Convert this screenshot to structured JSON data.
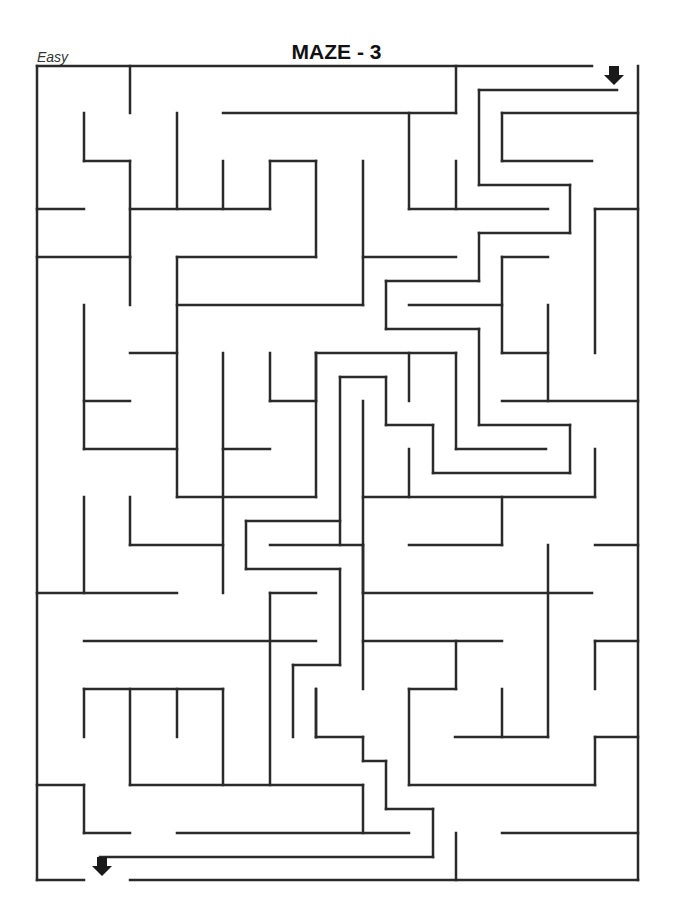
{
  "header": {
    "difficulty": "Easy",
    "title": "MAZE - 3"
  },
  "maze": {
    "wall_color": "#2a2a2a",
    "entrance": {
      "x": 614,
      "y": 76,
      "direction": "down"
    },
    "exit": {
      "x": 102,
      "y": 866,
      "direction": "down"
    },
    "walls": [
      [
        37,
        66,
        592,
        66
      ],
      [
        638,
        66,
        638,
        880
      ],
      [
        37,
        66,
        37,
        880
      ],
      [
        37,
        880,
        84,
        880
      ],
      [
        130,
        880,
        638,
        880
      ],
      [
        130,
        66,
        130,
        113
      ],
      [
        223,
        113,
        456,
        113
      ],
      [
        456,
        66,
        456,
        113
      ],
      [
        84,
        113,
        84,
        161
      ],
      [
        84,
        161,
        130,
        161
      ],
      [
        130,
        161,
        130,
        257
      ],
      [
        37,
        209,
        84,
        209
      ],
      [
        177,
        113,
        177,
        209
      ],
      [
        223,
        161,
        223,
        209
      ],
      [
        130,
        209,
        270,
        209
      ],
      [
        270,
        161,
        270,
        209
      ],
      [
        270,
        161,
        316,
        161
      ],
      [
        316,
        161,
        316,
        257
      ],
      [
        177,
        257,
        316,
        257
      ],
      [
        177,
        257,
        177,
        497
      ],
      [
        37,
        257,
        130,
        257
      ],
      [
        130,
        257,
        130,
        305
      ],
      [
        177,
        305,
        363,
        305
      ],
      [
        409,
        113,
        409,
        209
      ],
      [
        363,
        161,
        363,
        305
      ],
      [
        456,
        161,
        456,
        209
      ],
      [
        409,
        209,
        548,
        209
      ],
      [
        479,
        90,
        479,
        185
      ],
      [
        479,
        90,
        617,
        90
      ],
      [
        502,
        113,
        638,
        113
      ],
      [
        502,
        113,
        502,
        161
      ],
      [
        502,
        161,
        592,
        161
      ],
      [
        479,
        185,
        570,
        185
      ],
      [
        570,
        185,
        570,
        233
      ],
      [
        479,
        233,
        570,
        233
      ],
      [
        479,
        233,
        479,
        281
      ],
      [
        363,
        257,
        456,
        257
      ],
      [
        386,
        281,
        479,
        281
      ],
      [
        386,
        281,
        386,
        329
      ],
      [
        409,
        305,
        502,
        305
      ],
      [
        386,
        329,
        479,
        329
      ],
      [
        479,
        329,
        479,
        425
      ],
      [
        479,
        425,
        570,
        425
      ],
      [
        570,
        425,
        570,
        473
      ],
      [
        433,
        473,
        570,
        473
      ],
      [
        433,
        425,
        433,
        473
      ],
      [
        386,
        425,
        433,
        425
      ],
      [
        386,
        377,
        386,
        425
      ],
      [
        340,
        377,
        386,
        377
      ],
      [
        340,
        377,
        340,
        545
      ],
      [
        363,
        401,
        363,
        593
      ],
      [
        316,
        353,
        456,
        353
      ],
      [
        316,
        353,
        316,
        401
      ],
      [
        409,
        353,
        409,
        401
      ],
      [
        456,
        353,
        456,
        449
      ],
      [
        456,
        449,
        546,
        449
      ],
      [
        502,
        257,
        502,
        353
      ],
      [
        502,
        257,
        548,
        257
      ],
      [
        502,
        353,
        548,
        353
      ],
      [
        548,
        305,
        548,
        401
      ],
      [
        502,
        401,
        638,
        401
      ],
      [
        595,
        209,
        595,
        353
      ],
      [
        595,
        209,
        638,
        209
      ],
      [
        595,
        449,
        595,
        497
      ],
      [
        363,
        497,
        595,
        497
      ],
      [
        502,
        497,
        502,
        545
      ],
      [
        409,
        449,
        409,
        497
      ],
      [
        84,
        305,
        84,
        449
      ],
      [
        130,
        353,
        177,
        353
      ],
      [
        84,
        401,
        130,
        401
      ],
      [
        84,
        449,
        177,
        449
      ],
      [
        223,
        353,
        223,
        593
      ],
      [
        223,
        449,
        270,
        449
      ],
      [
        270,
        353,
        270,
        401
      ],
      [
        270,
        401,
        316,
        401
      ],
      [
        316,
        353,
        316,
        497
      ],
      [
        177,
        497,
        316,
        497
      ],
      [
        84,
        497,
        84,
        593
      ],
      [
        130,
        497,
        130,
        545
      ],
      [
        130,
        545,
        223,
        545
      ],
      [
        37,
        593,
        177,
        593
      ],
      [
        246,
        521,
        340,
        521
      ],
      [
        246,
        521,
        246,
        569
      ],
      [
        246,
        569,
        340,
        569
      ],
      [
        340,
        569,
        340,
        665
      ],
      [
        270,
        545,
        363,
        545
      ],
      [
        270,
        593,
        316,
        593
      ],
      [
        270,
        593,
        270,
        785
      ],
      [
        84,
        641,
        316,
        641
      ],
      [
        293,
        665,
        340,
        665
      ],
      [
        293,
        665,
        293,
        737
      ],
      [
        316,
        689,
        316,
        737
      ],
      [
        84,
        689,
        223,
        689
      ],
      [
        84,
        689,
        84,
        737
      ],
      [
        130,
        689,
        130,
        785
      ],
      [
        177,
        689,
        177,
        737
      ],
      [
        363,
        545,
        363,
        689
      ],
      [
        409,
        545,
        502,
        545
      ],
      [
        363,
        593,
        592,
        593
      ],
      [
        548,
        545,
        548,
        737
      ],
      [
        595,
        545,
        638,
        545
      ],
      [
        363,
        641,
        502,
        641
      ],
      [
        456,
        641,
        456,
        689
      ],
      [
        409,
        689,
        456,
        689
      ],
      [
        409,
        689,
        409,
        785
      ],
      [
        595,
        641,
        595,
        689
      ],
      [
        595,
        641,
        638,
        641
      ],
      [
        502,
        689,
        502,
        737
      ],
      [
        316,
        737,
        363,
        737
      ],
      [
        455,
        737,
        548,
        737
      ],
      [
        595,
        737,
        638,
        737
      ],
      [
        595,
        737,
        595,
        785
      ],
      [
        409,
        785,
        595,
        785
      ],
      [
        223,
        689,
        223,
        785
      ],
      [
        37,
        785,
        84,
        785
      ],
      [
        84,
        785,
        84,
        833
      ],
      [
        84,
        833,
        130,
        833
      ],
      [
        130,
        785,
        363,
        785
      ],
      [
        363,
        785,
        363,
        833
      ],
      [
        316,
        689,
        316,
        737
      ],
      [
        363,
        737,
        363,
        761
      ],
      [
        386,
        761,
        386,
        809
      ],
      [
        363,
        761,
        386,
        761
      ],
      [
        386,
        809,
        433,
        809
      ],
      [
        433,
        809,
        433,
        857
      ],
      [
        100,
        857,
        433,
        857
      ],
      [
        177,
        833,
        409,
        833
      ],
      [
        456,
        833,
        456,
        880
      ],
      [
        502,
        833,
        638,
        833
      ]
    ]
  }
}
